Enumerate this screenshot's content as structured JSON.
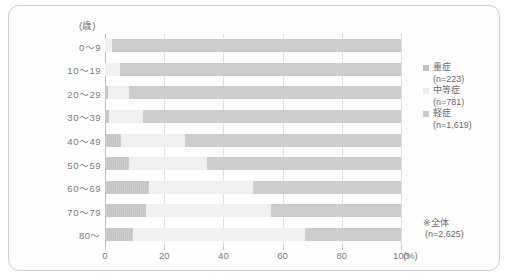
{
  "axis": {
    "unit_label": "(歳)",
    "x_ticks": [
      0,
      20,
      40,
      60,
      80,
      100
    ],
    "x_tick_labels": [
      "0",
      "20",
      "40",
      "60",
      "80",
      "100"
    ],
    "x_unit": "(%)"
  },
  "legend": {
    "items": [
      {
        "label": "重症",
        "n": "(n=223)",
        "color": "#c4c4c4"
      },
      {
        "label": "中等症",
        "n": "(n=781)",
        "color": "#ececec"
      },
      {
        "label": "軽症",
        "n": "(n=1,619)",
        "color": "#cbcbcb"
      }
    ]
  },
  "footnote": {
    "line1": "※全体",
    "line2": "(n=2,625)"
  },
  "chart_data": {
    "type": "bar",
    "orientation": "horizontal",
    "stacked": true,
    "normalized_percent": true,
    "title": "",
    "xlabel": "(%)",
    "ylabel": "(歳)",
    "xlim": [
      0,
      100
    ],
    "grid": true,
    "legend_position": "right",
    "categories": [
      "0〜9",
      "10〜19",
      "20〜29",
      "30〜39",
      "40〜49",
      "50〜59",
      "60〜69",
      "70〜79",
      "80〜"
    ],
    "series": [
      {
        "name": "重症",
        "n": 223,
        "color": "#c4c4c4",
        "values": [
          0.0,
          0.0,
          1.0,
          1.5,
          5.5,
          8.0,
          15.0,
          14.0,
          9.5
        ]
      },
      {
        "name": "中等症",
        "n": 781,
        "color": "#ececec",
        "values": [
          2.5,
          5.0,
          7.0,
          11.5,
          21.5,
          26.5,
          35.0,
          42.0,
          58.0
        ]
      },
      {
        "name": "軽症",
        "n": 1619,
        "color": "#cbcbcb",
        "values": [
          97.5,
          95.0,
          92.0,
          87.0,
          73.0,
          65.5,
          50.0,
          44.0,
          32.5
        ]
      }
    ],
    "total_n": 2625
  }
}
